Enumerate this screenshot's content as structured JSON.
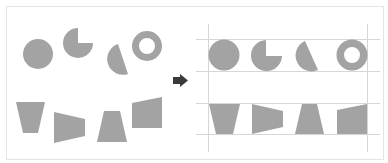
{
  "diagram": {
    "colors": {
      "shape_fill": "#a3a3a3",
      "arrow_fill": "#3a3a3a",
      "guide_line": "#d6d6d6",
      "frame_border": "#e4e4e4",
      "background": "#ffffff"
    },
    "before": {
      "label": "unaligned",
      "shapes": [
        {
          "type": "circle",
          "name": "circle"
        },
        {
          "type": "pie",
          "name": "three-quarter-pie"
        },
        {
          "type": "half-circle",
          "name": "tilted-half-circle"
        },
        {
          "type": "ring",
          "name": "ring"
        },
        {
          "type": "trapezoid",
          "name": "inverted-trapezoid"
        },
        {
          "type": "quad",
          "name": "skewed-quad"
        },
        {
          "type": "trapezoid",
          "name": "trapezoid"
        },
        {
          "type": "quad",
          "name": "slanted-top-quad"
        }
      ]
    },
    "arrow": {
      "direction": "right"
    },
    "after": {
      "label": "aligned to guides",
      "guides": {
        "horizontal": 4,
        "vertical": 2
      }
    }
  }
}
